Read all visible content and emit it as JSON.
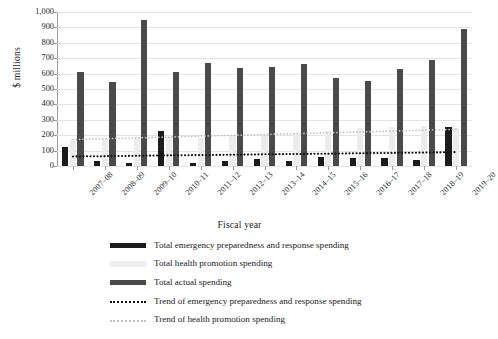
{
  "chart_data": {
    "type": "bar",
    "title": "",
    "xlabel": "Fiscal year",
    "ylabel": "$ millions",
    "ylim": [
      0,
      1000
    ],
    "yticks": [
      "0",
      "100",
      "200",
      "300",
      "400",
      "500",
      "600",
      "700",
      "800",
      "900",
      "1,000"
    ],
    "ytick_values": [
      0,
      100,
      200,
      300,
      400,
      500,
      600,
      700,
      800,
      900,
      1000
    ],
    "grid": true,
    "legend_position": "bottom",
    "categories": [
      "2007–08",
      "2008–09",
      "2009–10",
      "2010–11",
      "2011–12",
      "2012–13",
      "2013–14",
      "2014–15",
      "2015–16",
      "2016–17",
      "2017–18",
      "2018–19",
      "2019–20"
    ],
    "series": [
      {
        "name": "Total emergency preparedness and response spending",
        "type": "bar",
        "color": "#1c1c1c",
        "values": [
          125,
          35,
          20,
          225,
          20,
          35,
          45,
          30,
          60,
          55,
          50,
          40,
          255
        ]
      },
      {
        "name": "Total health promotion spending",
        "type": "bar",
        "color": "#ececec",
        "values": [
          175,
          175,
          180,
          190,
          185,
          195,
          195,
          210,
          230,
          250,
          255,
          260,
          250
        ]
      },
      {
        "name": "Total actual spending",
        "type": "bar",
        "color": "#4a4a4a",
        "values": [
          610,
          545,
          950,
          610,
          670,
          635,
          645,
          660,
          570,
          550,
          630,
          690,
          890
        ]
      },
      {
        "name": "Trend of emergency preparedness and response spending",
        "type": "line",
        "style": "dotted",
        "color": "#111111",
        "values": [
          62,
          64,
          66,
          69,
          71,
          73,
          76,
          78,
          80,
          83,
          85,
          87,
          90
        ]
      },
      {
        "name": "Trend of health promotion spending",
        "type": "line",
        "style": "dotted",
        "color": "#c2c2c2",
        "values": [
          172,
          177,
          183,
          188,
          194,
          199,
          205,
          210,
          216,
          221,
          227,
          232,
          238
        ]
      }
    ]
  },
  "legend": {
    "items": [
      {
        "label": "Total emergency preparedness and response spending",
        "key": "solid-dark"
      },
      {
        "label": "Total health promotion spending",
        "key": "solid-light"
      },
      {
        "label": "Total actual spending",
        "key": "solid-mid"
      },
      {
        "label": "Trend of emergency preparedness and response spending",
        "key": "dotted-dark"
      },
      {
        "label": "Trend of health promotion spending",
        "key": "dotted-light"
      }
    ]
  }
}
